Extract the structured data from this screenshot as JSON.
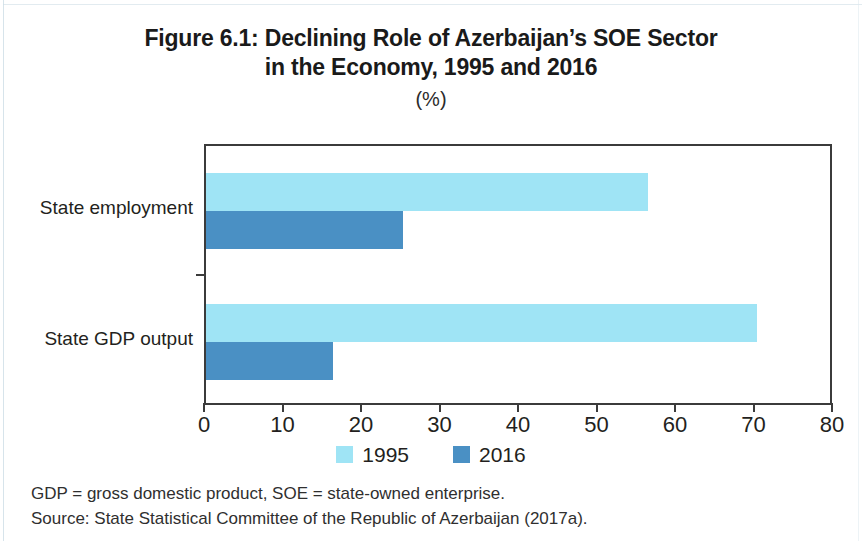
{
  "figure": {
    "title_line_1": "Figure 6.1: Declining Role of Azerbaijan’s SOE Sector",
    "title_line_2": "in the Economy, 1995 and 2016",
    "subtitle": "(%)",
    "footnote_abbreviations": "GDP = gross domestic product, SOE = state-owned enterprise.",
    "footnote_source": "Source: State Statistical Committee of the Republic of Azerbaijan (2017a)."
  },
  "colors": {
    "series_1995": "#9FE4F5",
    "series_2016": "#4A90C4",
    "axis": "#3B3B3B",
    "text": "#231F20"
  },
  "chart_data": {
    "type": "bar",
    "orientation": "horizontal",
    "title": "Figure 6.1: Declining Role of Azerbaijan’s SOE Sector in the Economy, 1995 and 2016",
    "subtitle": "(%)",
    "xlabel": "",
    "ylabel": "",
    "xlim": [
      0,
      80
    ],
    "ylim": null,
    "xticks": [
      0,
      10,
      20,
      30,
      40,
      50,
      60,
      70,
      80
    ],
    "xticklabels": [
      "0",
      "10",
      "20",
      "30",
      "40",
      "50",
      "60",
      "70",
      "80"
    ],
    "grid": false,
    "legend_position": "bottom-center",
    "categories": [
      "State employment",
      "State GDP output"
    ],
    "series": [
      {
        "name": "1995",
        "color": "#9FE4F5",
        "values": [
          56.3,
          70.2
        ]
      },
      {
        "name": "2016",
        "color": "#4A90C4",
        "values": [
          25.1,
          16.2
        ]
      }
    ]
  }
}
